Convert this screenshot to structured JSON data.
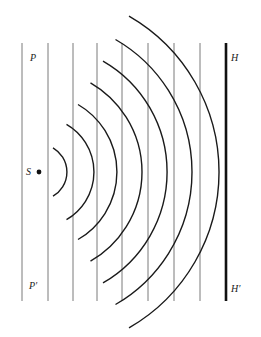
{
  "diagram": {
    "type": "wavefront-diagram",
    "labels": {
      "P": "P",
      "P_prime": "P′",
      "S": "S",
      "H": "H",
      "H_prime": "H′"
    },
    "source": {
      "x": 39,
      "y": 172
    },
    "plane_wavefronts_x": [
      22,
      48,
      73,
      97,
      122,
      148,
      174,
      200
    ],
    "plane_wavefront_y_range": [
      43,
      301
    ],
    "barrier": {
      "x": 226,
      "y_top": 43,
      "y_bottom": 301
    },
    "circular_wavefront_radii": [
      28,
      55,
      78,
      103,
      128,
      153,
      180
    ],
    "colors": {
      "thin_line": "#7a7a7a",
      "arc": "#1a1a1a",
      "barrier": "#111111"
    }
  }
}
